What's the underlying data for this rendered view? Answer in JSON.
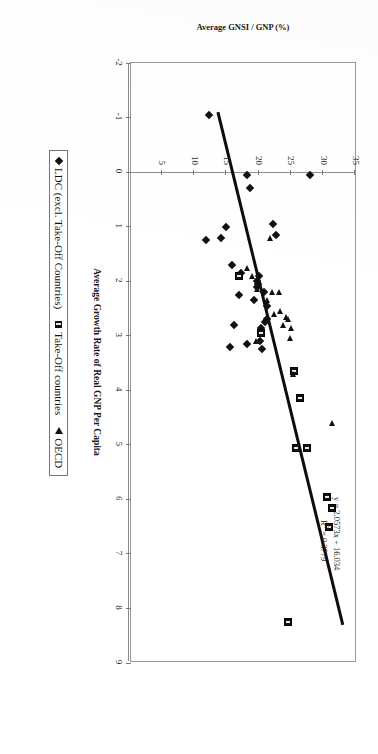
{
  "chart_data": {
    "type": "scatter",
    "title": "",
    "xlabel": "Average Growth Rate of Real GNP Per Capita",
    "ylabel": "Average GNSI / GNP (%)",
    "xlim": [
      -2,
      9
    ],
    "ylim": [
      0,
      35
    ],
    "xticks": [
      -2,
      -1,
      0,
      1,
      2,
      3,
      4,
      5,
      6,
      7,
      8,
      9
    ],
    "xticklabels": [
      "-2",
      "-1",
      "0",
      "1",
      "2",
      "3",
      "4",
      "5",
      "6",
      "7",
      "8",
      "9"
    ],
    "yticks": [
      0,
      5,
      10,
      15,
      20,
      25,
      30,
      35
    ],
    "yticklabels": [
      "0",
      "5",
      "10",
      "15",
      "20",
      "25",
      "30",
      "35"
    ],
    "grid": false,
    "legend_position": "bottom",
    "annotations": {
      "equation": "y = 2.0573x + 16.034",
      "r_squared_prefix": "R",
      "r_squared_exp": "2",
      "r_squared_value": " = 0.3779"
    },
    "trendline": {
      "slope": 2.0573,
      "intercept": 16.034,
      "r_squared": 0.3779,
      "x_start": -1.1,
      "x_end": 8.3
    },
    "series": [
      {
        "name": "LDC (excl. Take-Off Countries)",
        "marker": "filled-diamond",
        "color": "#111111",
        "points": [
          [
            -1.05,
            12.4
          ],
          [
            0.05,
            18.3
          ],
          [
            0.3,
            18.8
          ],
          [
            0.05,
            28.1
          ],
          [
            0.95,
            22.3
          ],
          [
            1.0,
            15.0
          ],
          [
            1.15,
            22.7
          ],
          [
            1.2,
            14.2
          ],
          [
            1.25,
            11.9
          ],
          [
            1.7,
            16.0
          ],
          [
            1.85,
            17.3
          ],
          [
            1.9,
            20.1
          ],
          [
            2.0,
            19.8
          ],
          [
            2.05,
            20.0
          ],
          [
            2.1,
            19.9
          ],
          [
            2.2,
            20.9
          ],
          [
            2.25,
            17.0
          ],
          [
            2.35,
            19.3
          ],
          [
            2.45,
            21.3
          ],
          [
            2.7,
            21.4
          ],
          [
            2.75,
            21.0
          ],
          [
            2.8,
            16.3
          ],
          [
            2.85,
            20.5
          ],
          [
            3.1,
            20.3
          ],
          [
            3.15,
            18.2
          ],
          [
            3.2,
            15.6
          ],
          [
            3.25,
            20.6
          ]
        ]
      },
      {
        "name": "Take-Off countries",
        "marker": "filled-square",
        "color": "#111111",
        "points": [
          [
            1.9,
            17.1
          ],
          [
            2.95,
            20.5
          ],
          [
            3.65,
            25.6
          ],
          [
            4.15,
            26.5
          ],
          [
            5.05,
            27.5
          ],
          [
            5.05,
            25.9
          ],
          [
            5.95,
            30.7
          ],
          [
            6.15,
            31.5
          ],
          [
            6.5,
            31.0
          ],
          [
            8.25,
            24.6
          ]
        ]
      },
      {
        "name": "OECD",
        "marker": "filled-triangle",
        "color": "#111111",
        "points": [
          [
            1.2,
            21.8
          ],
          [
            1.75,
            18.2
          ],
          [
            1.9,
            19.1
          ],
          [
            2.15,
            19.9
          ],
          [
            2.2,
            22.2
          ],
          [
            2.2,
            23.3
          ],
          [
            2.35,
            21.4
          ],
          [
            2.55,
            23.4
          ],
          [
            2.6,
            22.5
          ],
          [
            2.65,
            24.3
          ],
          [
            2.7,
            24.6
          ],
          [
            2.8,
            23.9
          ],
          [
            2.85,
            25.1
          ],
          [
            3.05,
            24.9
          ],
          [
            3.1,
            19.7
          ],
          [
            3.7,
            25.4
          ],
          [
            4.6,
            31.4
          ]
        ]
      }
    ]
  },
  "legend": {
    "items": [
      {
        "label": "LDC (excl. Take-Off Countries)",
        "marker": "diamond-icon"
      },
      {
        "label": "Take-Off countries",
        "marker": "square-icon"
      },
      {
        "label": "OECD",
        "marker": "triangle-icon"
      }
    ]
  },
  "colors": {
    "ink": "#111111",
    "axis": "#8c8c8c",
    "frame": "#9a9a9a",
    "page": "#ffffff"
  }
}
